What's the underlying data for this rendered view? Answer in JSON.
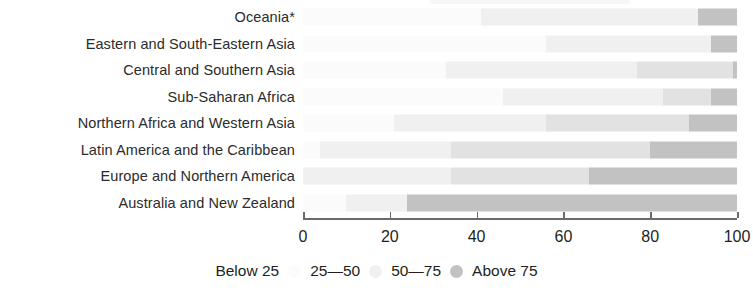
{
  "chart_data": {
    "type": "bar",
    "orientation": "horizontal",
    "stacked": true,
    "title": "",
    "xlabel": "",
    "ylabel": "",
    "xlim": [
      0,
      100
    ],
    "xticks": [
      0,
      20,
      40,
      60,
      80,
      100
    ],
    "xtick_labels": [
      "0",
      "20",
      "40",
      "60",
      "80",
      "100"
    ],
    "grid": false,
    "legend_position": "bottom-center",
    "categories": [
      "Oceania*",
      "Eastern and South-Eastern Asia",
      "Central and Southern Asia",
      "Sub-Saharan Africa",
      "Northern Africa and Western Asia",
      "Latin America and the Caribbean",
      "Europe and Northern America",
      "Australia and New Zealand"
    ],
    "series": [
      {
        "name": "Below 25",
        "color": "#fbfbfb",
        "values": [
          41,
          56,
          33,
          46,
          21,
          4,
          0,
          10
        ]
      },
      {
        "name": "25—50",
        "color": "#f0f0f0",
        "values": [
          50,
          38,
          44,
          37,
          35,
          30,
          34,
          14
        ]
      },
      {
        "name": "50—75",
        "color": "#e2e2e2",
        "values": [
          0,
          0,
          22,
          11,
          33,
          46,
          32,
          0
        ]
      },
      {
        "name": "Above 75",
        "color": "#c2c2c2",
        "values": [
          9,
          6,
          1,
          6,
          11,
          20,
          34,
          76
        ]
      }
    ]
  },
  "legend": {
    "items": [
      {
        "label": "Below 25",
        "swatch": "s1"
      },
      {
        "label": "25—50",
        "swatch": "s2"
      },
      {
        "label": "50—75",
        "swatch": "s3"
      },
      {
        "label": "Above 75",
        "swatch": "s4"
      }
    ]
  },
  "colors": {
    "below25": "#fbfbfb",
    "range2550": "#f0f0f0",
    "range5075": "#e2e2e2",
    "above75": "#c2c2c2",
    "axis": "#6b6b6b",
    "text": "#231f20"
  }
}
